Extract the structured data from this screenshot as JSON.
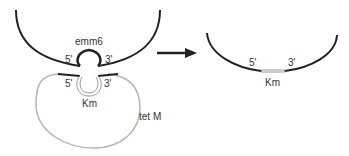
{
  "diagram": {
    "left": {
      "upper_label": "emm6",
      "upper_5prime": "5'",
      "upper_3prime": "3'",
      "lower_5prime": "5'",
      "lower_3prime": "3'",
      "insert_label": "Km",
      "plasmid_label": "tet M"
    },
    "right": {
      "label_5prime": "5'",
      "label_3prime": "3'",
      "insert_label": "Km"
    },
    "colors": {
      "chromosome": "#222222",
      "plasmid": "#b5b5b5",
      "insert": "#999999",
      "arrow": "#222222"
    }
  }
}
